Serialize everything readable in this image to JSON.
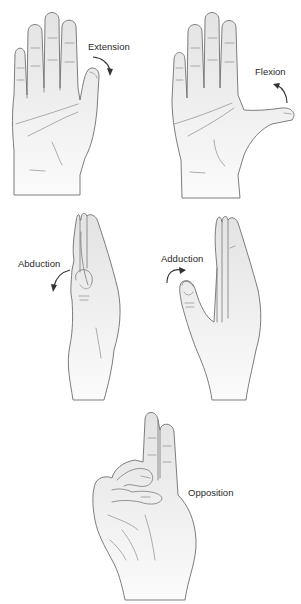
{
  "figure": {
    "panels": [
      {
        "id": "extension",
        "label": "Extension",
        "description": "Open palm, thumb moving away from palm (arrow curving downward)"
      },
      {
        "id": "flexion",
        "label": "Flexion",
        "description": "Open palm, thumb extended across palm (arrow curving upward)"
      },
      {
        "id": "abduction",
        "label": "Abduction",
        "description": "Side view of hand, thumb moving away from fingers"
      },
      {
        "id": "adduction",
        "label": "Adduction",
        "description": "Side view of hand, thumb moving toward fingers"
      },
      {
        "id": "opposition",
        "label": "Opposition",
        "description": "Thumb touching ring finger, index and middle fingers raised"
      }
    ],
    "colors": {
      "outline": "#6e6e6e",
      "skin_top": "#e6e6e6",
      "skin_bottom": "#fbfbfb",
      "arrow": "#333333",
      "text": "#2a2a2a"
    }
  }
}
